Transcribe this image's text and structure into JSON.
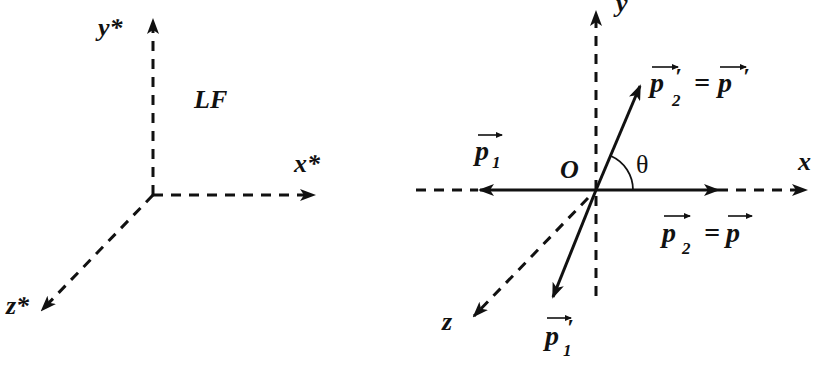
{
  "left_frame": {
    "name": "LF",
    "axes": {
      "y": "y*",
      "x": "x*",
      "z": "z*"
    }
  },
  "right_frame": {
    "origin_label": "O",
    "axes": {
      "y": "y",
      "x": "x",
      "z": "z"
    },
    "angle_label": "θ",
    "vectors": {
      "p1": {
        "base": "p",
        "sub": "1",
        "prime": ""
      },
      "p2": {
        "base": "p",
        "sub": "2",
        "eq": "=",
        "rhs": "p",
        "prime": ""
      },
      "p2prime": {
        "base": "p",
        "sub": "2",
        "prime": "′",
        "eq": "=",
        "rhs": "p",
        "rhs_prime": "′"
      },
      "p1prime": {
        "base": "p",
        "sub": "1",
        "prime": "′"
      }
    }
  }
}
